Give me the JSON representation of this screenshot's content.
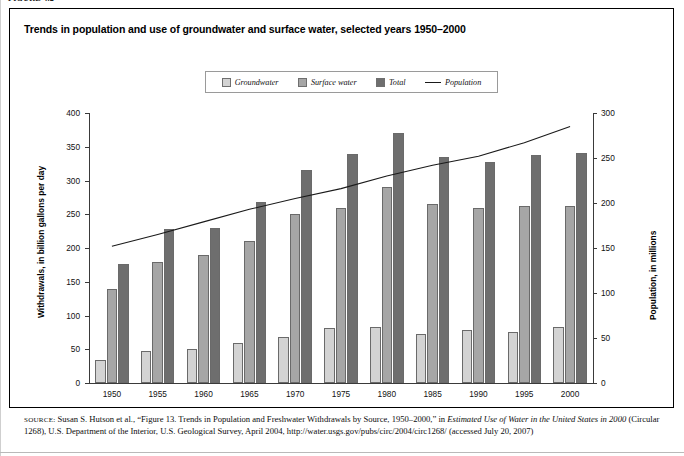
{
  "figure_label": "FIGURE 4.2",
  "title": "Trends in population and use of groundwater and surface water, selected years 1950–2000",
  "legend": {
    "items": [
      {
        "label": "Groundwater",
        "swatch": "#d3d3d3",
        "marker": "square"
      },
      {
        "label": "Surface water",
        "swatch": "#a6a6a6",
        "marker": "square"
      },
      {
        "label": "Total",
        "swatch": "#6e6e6e",
        "marker": "square"
      },
      {
        "label": "Population",
        "swatch": "#1a1a1a",
        "marker": "line"
      }
    ]
  },
  "source": {
    "prefix": "SOURCE:",
    "text_1": " Susan S. Hutson et al., “Figure 13. Trends in Population and Freshwater Withdrawals by Source, 1950–2000,” in ",
    "italic_1": "Estimated Use of Water in the United States in 2000",
    "text_2": " (Circular 1268), U.S. Department of the Interior, U.S. Geological Survey, April 2004, http://water.usgs.gov/pubs/circ/2004/circ1268/ (accessed July 20, 2007)"
  },
  "chart_data": {
    "type": "bar",
    "title": "Trends in population and use of groundwater and surface water, selected years 1950–2000",
    "xlabel": "",
    "ylabel": "Withdrawals, in billion gallons per day",
    "y2label": "Population, in millions",
    "categories": [
      "1950",
      "1955",
      "1960",
      "1965",
      "1970",
      "1975",
      "1980",
      "1985",
      "1990",
      "1995",
      "2000"
    ],
    "ylim": [
      0,
      400
    ],
    "yticks": [
      0,
      50,
      100,
      150,
      200,
      250,
      300,
      350,
      400
    ],
    "y2lim": [
      0,
      300
    ],
    "y2ticks": [
      0,
      50,
      100,
      150,
      200,
      250,
      300
    ],
    "grid": false,
    "legend_position": "top-center",
    "series": [
      {
        "name": "Groundwater",
        "color": "#d3d3d3",
        "type": "bar",
        "values": [
          34,
          47,
          50,
          60,
          68,
          82,
          83,
          73,
          79,
          76,
          83
        ]
      },
      {
        "name": "Surface water",
        "color": "#a6a6a6",
        "type": "bar",
        "values": [
          140,
          180,
          190,
          210,
          250,
          260,
          290,
          265,
          259,
          262,
          262
        ]
      },
      {
        "name": "Total",
        "color": "#6e6e6e",
        "type": "bar",
        "values": [
          176,
          228,
          230,
          268,
          316,
          340,
          370,
          335,
          327,
          338,
          341
        ]
      },
      {
        "name": "Population",
        "color": "#1a1a1a",
        "type": "line",
        "axis": "right",
        "values": [
          152,
          165,
          179,
          193,
          205,
          216,
          230,
          242,
          252,
          267,
          285
        ]
      }
    ]
  }
}
